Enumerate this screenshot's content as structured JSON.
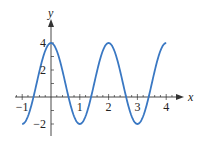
{
  "chart_data": {
    "type": "line",
    "title": "",
    "xlabel": "x",
    "ylabel": "y",
    "xlim": [
      -1.2,
      4.6
    ],
    "ylim": [
      -2.8,
      5.0
    ],
    "x_ticks": [
      -1,
      1,
      2,
      3,
      4
    ],
    "x_tick_labels": [
      "−1",
      "1",
      "2",
      "3",
      "4"
    ],
    "y_ticks": [
      4,
      2,
      -2
    ],
    "y_tick_labels": [
      "4",
      "2",
      "−2"
    ],
    "grid": false,
    "legend": null,
    "function": "y = 1 + 3cos(πx)",
    "domain": [
      -1,
      4
    ],
    "series": [
      {
        "name": "curve",
        "color": "#3a78c3",
        "x": [
          -1,
          -0.5,
          0,
          0.5,
          1,
          1.5,
          2,
          2.5,
          3,
          3.5,
          4
        ],
        "y": [
          -2,
          1,
          4,
          1,
          -2,
          1,
          4,
          1,
          -2,
          1,
          4
        ]
      }
    ]
  }
}
